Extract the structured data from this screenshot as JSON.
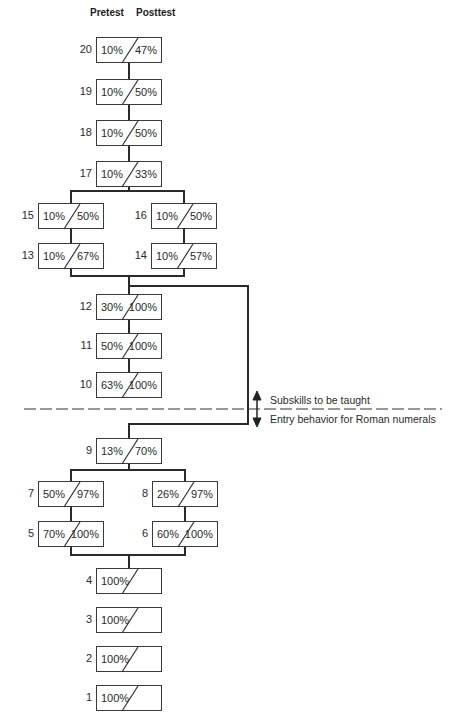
{
  "headers": {
    "pretest": "Pretest",
    "posttest": "Posttest"
  },
  "skills": [
    {
      "id": "20",
      "pretest": "10%",
      "posttest": "47%"
    },
    {
      "id": "19",
      "pretest": "10%",
      "posttest": "50%"
    },
    {
      "id": "18",
      "pretest": "10%",
      "posttest": "50%"
    },
    {
      "id": "17",
      "pretest": "10%",
      "posttest": "33%"
    },
    {
      "id": "15",
      "pretest": "10%",
      "posttest": "50%"
    },
    {
      "id": "16",
      "pretest": "10%",
      "posttest": "50%"
    },
    {
      "id": "13",
      "pretest": "10%",
      "posttest": "67%"
    },
    {
      "id": "14",
      "pretest": "10%",
      "posttest": "57%"
    },
    {
      "id": "12",
      "pretest": "30%",
      "posttest": "100%"
    },
    {
      "id": "11",
      "pretest": "50%",
      "posttest": "100%"
    },
    {
      "id": "10",
      "pretest": "63%",
      "posttest": "100%"
    },
    {
      "id": "9",
      "pretest": "13%",
      "posttest": "70%"
    },
    {
      "id": "7",
      "pretest": "50%",
      "posttest": "97%"
    },
    {
      "id": "8",
      "pretest": "26%",
      "posttest": "97%"
    },
    {
      "id": "5",
      "pretest": "70%",
      "posttest": "100%"
    },
    {
      "id": "6",
      "pretest": "60%",
      "posttest": "100%"
    },
    {
      "id": "4",
      "pretest": "100%",
      "posttest": ""
    },
    {
      "id": "3",
      "pretest": "100%",
      "posttest": ""
    },
    {
      "id": "2",
      "pretest": "100%",
      "posttest": ""
    },
    {
      "id": "1",
      "pretest": "100%",
      "posttest": ""
    }
  ],
  "divider": {
    "above_label": "Subskills to be taught",
    "below_label": "Entry behavior for Roman numerals"
  }
}
